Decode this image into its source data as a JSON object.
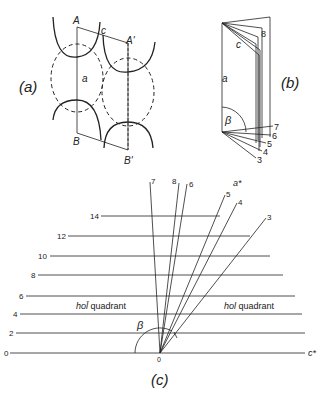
{
  "panel_a": {
    "label": "(a)",
    "points": {
      "A": "A",
      "A_prime": "A'",
      "B": "B",
      "B_prime": "B'",
      "c": "c",
      "a": "a"
    }
  },
  "panel_b": {
    "label": "(b)",
    "axis_a": "a",
    "axis_c": "c",
    "angle": "β",
    "top_index": "8",
    "bottom_indices": [
      "7",
      "6",
      "5",
      "4",
      "3"
    ]
  },
  "panel_c": {
    "label": "(c)",
    "row_labels": [
      "0",
      "2",
      "4",
      "6",
      "8",
      "10",
      "12",
      "14"
    ],
    "ray_labels": [
      "7",
      "8",
      "6",
      "5",
      "4",
      "3"
    ],
    "axis_a_star": "a*",
    "axis_c_star": "c*",
    "origin": "0",
    "angle": "β",
    "left_quadrant_index": "hol̄",
    "left_quadrant_word": "quadrant",
    "right_quadrant_index": "hol",
    "right_quadrant_word": "quadrant"
  }
}
